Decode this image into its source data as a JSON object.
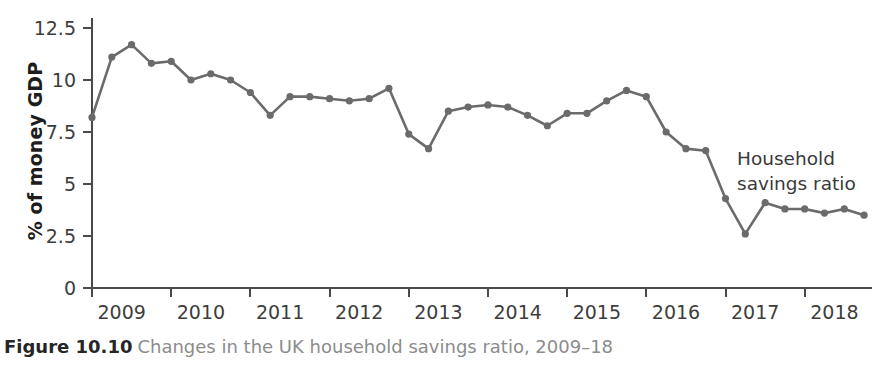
{
  "figure": {
    "caption_label": "Figure 10.10",
    "caption_text": "Changes in the UK household savings ratio, 2009–18"
  },
  "annotation": {
    "text": "Household\nsavings ratio"
  },
  "colors": {
    "series": "#6b6b6b",
    "axis": "#4a4a4a",
    "tick_text": "#3d3d3d",
    "caption_text": "#8c8c8c",
    "caption_label": "#262626",
    "background": "#ffffff"
  },
  "chart_data": {
    "type": "line",
    "title": "",
    "subtitle": "",
    "xlabel": "",
    "ylabel": "% of money GDP",
    "ylim": [
      0,
      12.5
    ],
    "ytick_labels": [
      "0",
      "2.5",
      "5",
      "7.5",
      "10",
      "12.5"
    ],
    "ytick_values": [
      0,
      2.5,
      5,
      7.5,
      10,
      12.5
    ],
    "xtick_labels": [
      "2009",
      "2010",
      "2011",
      "2012",
      "2013",
      "2014",
      "2015",
      "2016",
      "2017",
      "2018"
    ],
    "xtick_values": [
      2009,
      2010,
      2011,
      2012,
      2013,
      2014,
      2015,
      2016,
      2017,
      2018
    ],
    "xlim": [
      2008.75,
      2018.6
    ],
    "grid": false,
    "legend": "annotation-right",
    "series": [
      {
        "name": "Household savings ratio",
        "x": [
          2008.75,
          2009.0,
          2009.25,
          2009.5,
          2009.75,
          2010.0,
          2010.25,
          2010.5,
          2010.75,
          2011.0,
          2011.25,
          2011.5,
          2011.75,
          2012.0,
          2012.25,
          2012.5,
          2012.75,
          2013.0,
          2013.25,
          2013.5,
          2013.75,
          2014.0,
          2014.25,
          2014.5,
          2014.75,
          2015.0,
          2015.25,
          2015.5,
          2015.75,
          2016.0,
          2016.25,
          2016.5,
          2016.75,
          2017.0,
          2017.25,
          2017.5,
          2017.75,
          2018.0,
          2018.25,
          2018.5
        ],
        "values": [
          8.2,
          11.1,
          11.7,
          10.8,
          10.9,
          10.0,
          10.3,
          10.0,
          9.4,
          8.3,
          9.2,
          9.2,
          9.1,
          9.0,
          9.1,
          9.6,
          7.4,
          6.7,
          8.5,
          8.7,
          8.8,
          8.7,
          8.3,
          7.8,
          8.4,
          8.4,
          9.0,
          9.5,
          9.2,
          7.5,
          6.7,
          6.6,
          4.3,
          2.6,
          4.1,
          3.8,
          3.8,
          3.6,
          3.8,
          3.5
        ]
      }
    ]
  }
}
